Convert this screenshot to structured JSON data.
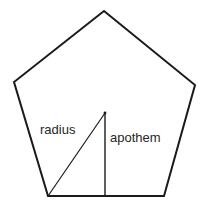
{
  "figure": {
    "background_color": "#ffffff",
    "stroke_color": "#1a1a1a",
    "text_color": "#262626",
    "width": 208,
    "height": 212
  },
  "labels": {
    "radius": "radius",
    "apothem": "apothem"
  },
  "geometry": {
    "shape": "regular-pentagon",
    "sides": 5,
    "vertices": [
      {
        "name": "apex",
        "x": 104,
        "y": 11
      },
      {
        "name": "upper-right",
        "x": 195,
        "y": 85
      },
      {
        "name": "lower-right",
        "x": 164,
        "y": 196
      },
      {
        "name": "lower-left",
        "x": 48,
        "y": 196
      },
      {
        "name": "upper-left",
        "x": 14,
        "y": 82
      }
    ],
    "center": {
      "x": 105,
      "y": 113
    },
    "radius_segment": {
      "from": {
        "x": 105,
        "y": 113
      },
      "to": {
        "x": 48,
        "y": 196
      },
      "stroke_width": 1
    },
    "apothem_segment": {
      "from": {
        "x": 105,
        "y": 113
      },
      "to": {
        "x": 105,
        "y": 196
      },
      "stroke_width": 1
    },
    "outline_stroke_width": 2,
    "polygon_points": "104,11 195,85 164,196 48,196 14,82"
  }
}
